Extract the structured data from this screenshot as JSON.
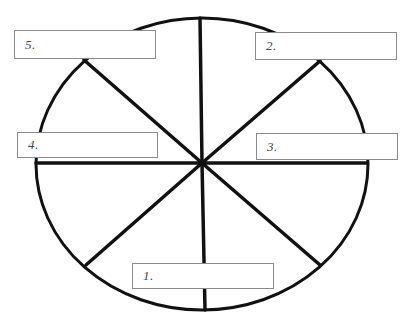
{
  "diagram": {
    "type": "wheel-of-sections",
    "outline_color": "#111111",
    "box_border_color": "#8a8a8a",
    "text_color": "#444444",
    "labels": [
      {
        "id": "1",
        "text": "1.",
        "position": "bottom"
      },
      {
        "id": "2",
        "text": "2.",
        "position": "top-right"
      },
      {
        "id": "3",
        "text": "3.",
        "position": "right"
      },
      {
        "id": "4",
        "text": "4.",
        "position": "left"
      },
      {
        "id": "5",
        "text": "5.",
        "position": "top-left"
      }
    ],
    "ellipse": {
      "cx": 202,
      "cy": 164,
      "rx": 166,
      "ry": 146
    },
    "hub": {
      "x": 202,
      "y": 163
    },
    "spokes": [
      {
        "name": "top",
        "x": 200,
        "y": 18
      },
      {
        "name": "bottom",
        "x": 205,
        "y": 310
      },
      {
        "name": "left",
        "x": 36,
        "y": 163
      },
      {
        "name": "right",
        "x": 367,
        "y": 163
      },
      {
        "name": "upper-left",
        "x": 84,
        "y": 60
      },
      {
        "name": "upper-right",
        "x": 320,
        "y": 61
      },
      {
        "name": "lower-left",
        "x": 86,
        "y": 265
      },
      {
        "name": "lower-right",
        "x": 320,
        "y": 265
      }
    ]
  }
}
